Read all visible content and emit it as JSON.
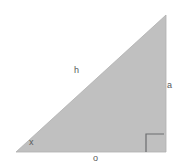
{
  "figure": {
    "kind": "right-triangle-diagram",
    "background_color": "#ffffff",
    "triangle": {
      "name": "right-triangle",
      "fill_color": "#c0c0c0",
      "stroke_color": "#b0b0b0",
      "vertices": [
        {
          "name": "left-vertex",
          "x": 16,
          "y": 152
        },
        {
          "name": "bottom-right-vertex",
          "x": 166,
          "y": 152
        },
        {
          "name": "apex-vertex",
          "x": 166,
          "y": 15
        }
      ]
    },
    "right_angle_marker": {
      "name": "right-angle-marker",
      "stroke_color": "#6b6c6e",
      "x": 146,
      "y": 134,
      "size": 18
    },
    "labels": [
      {
        "id": "h",
        "text": "h",
        "role": "hypotenuse-label",
        "x": 74,
        "y": 66
      },
      {
        "id": "a",
        "text": "a",
        "role": "opposite-side-label",
        "x": 167,
        "y": 81
      },
      {
        "id": "x",
        "text": "x",
        "role": "angle-label",
        "x": 29,
        "y": 138
      },
      {
        "id": "o",
        "text": "o",
        "role": "adjacent-side-label",
        "x": 93,
        "y": 154
      }
    ],
    "label_color": "#58595b"
  }
}
